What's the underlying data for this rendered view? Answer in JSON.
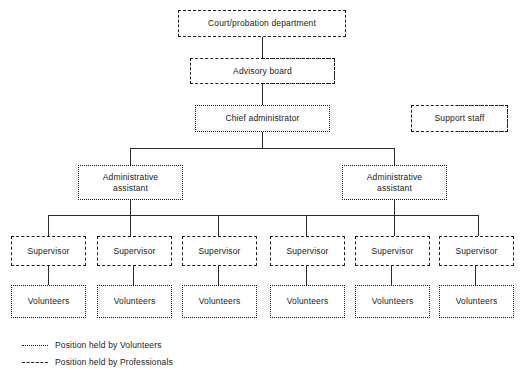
{
  "diagram": {
    "line_color": "#2a2a2a",
    "text_color": "#1a1a1a",
    "background": "#ffffff"
  },
  "nodes": {
    "court": {
      "label": "Court/probation department",
      "style": "professionals"
    },
    "advisory": {
      "label": "Advisory board",
      "style": "mixed"
    },
    "chief": {
      "label": "Chief administrator",
      "style": "volunteers"
    },
    "support": {
      "label": "Support staff",
      "style": "mixed"
    },
    "admin_assistants": [
      {
        "label": "Administrative\nassistant",
        "style": "volunteers"
      },
      {
        "label": "Administrative\nassistant",
        "style": "volunteers"
      }
    ],
    "supervisors": [
      {
        "label": "Supervisor",
        "style": "professionals"
      },
      {
        "label": "Supervisor",
        "style": "professionals"
      },
      {
        "label": "Supervisor",
        "style": "professionals"
      },
      {
        "label": "Supervisor",
        "style": "professionals"
      },
      {
        "label": "Supervisor",
        "style": "professionals"
      },
      {
        "label": "Supervisor",
        "style": "professionals"
      }
    ],
    "volunteers": [
      {
        "label": "Volunteers",
        "style": "volunteers"
      },
      {
        "label": "Volunteers",
        "style": "volunteers"
      },
      {
        "label": "Volunteers",
        "style": "volunteers"
      },
      {
        "label": "Volunteers",
        "style": "volunteers"
      },
      {
        "label": "Volunteers",
        "style": "volunteers"
      },
      {
        "label": "Volunteers",
        "style": "volunteers"
      }
    ]
  },
  "legend": {
    "volunteers": {
      "marker": "dotted-line",
      "text": "Position held by Volunteers"
    },
    "professionals": {
      "marker": "dashed-line",
      "text": "Position held by Professionals"
    }
  }
}
